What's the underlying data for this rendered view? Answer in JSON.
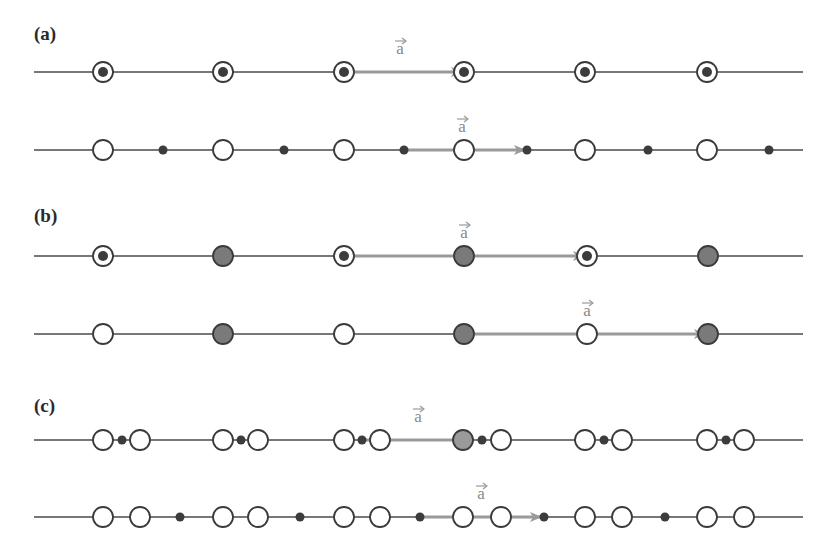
{
  "colors": {
    "line": "#4a4a4a",
    "atom_stroke": "#3a3a3a",
    "dot": "#3c3c3c",
    "gray_fill": "#7a7a7a",
    "arrow": "#9a9a9a",
    "background": "#ffffff"
  },
  "panels": [
    {
      "label": "(a)",
      "label_pos": [
        34,
        40
      ],
      "rows": [
        {
          "y": 72,
          "circles": [
            {
              "x": 103,
              "type": "ring-dot"
            },
            {
              "x": 223,
              "type": "ring-dot"
            },
            {
              "x": 344,
              "type": "ring-dot"
            },
            {
              "x": 464,
              "type": "ring-dot"
            },
            {
              "x": 585,
              "type": "ring-dot"
            },
            {
              "x": 707,
              "type": "ring-dot"
            }
          ],
          "dots": [],
          "vector": {
            "x1": 344,
            "x2": 462,
            "label": "a",
            "label_x": 400
          }
        },
        {
          "y": 150,
          "circles": [
            {
              "x": 103,
              "type": "open"
            },
            {
              "x": 223,
              "type": "open"
            },
            {
              "x": 344,
              "type": "open"
            },
            {
              "x": 464,
              "type": "open"
            },
            {
              "x": 585,
              "type": "open"
            },
            {
              "x": 707,
              "type": "open"
            }
          ],
          "dots": [
            163,
            284,
            404,
            527,
            648,
            769
          ],
          "vector": {
            "x1": 404,
            "x2": 525,
            "label": "a",
            "label_x": 462
          }
        }
      ]
    },
    {
      "label": "(b)",
      "label_pos": [
        34,
        222
      ],
      "rows": [
        {
          "y": 256,
          "circles": [
            {
              "x": 103,
              "type": "ring-dot"
            },
            {
              "x": 223,
              "type": "gray"
            },
            {
              "x": 344,
              "type": "ring-dot"
            },
            {
              "x": 464,
              "type": "gray"
            },
            {
              "x": 587,
              "type": "ring-dot"
            },
            {
              "x": 708,
              "type": "gray"
            }
          ],
          "dots": [],
          "vector": {
            "x1": 344,
            "x2": 584,
            "label": "a",
            "label_x": 464
          }
        },
        {
          "y": 334,
          "circles": [
            {
              "x": 103,
              "type": "open"
            },
            {
              "x": 223,
              "type": "gray"
            },
            {
              "x": 344,
              "type": "open"
            },
            {
              "x": 464,
              "type": "gray"
            },
            {
              "x": 587,
              "type": "open"
            },
            {
              "x": 708,
              "type": "gray"
            }
          ],
          "dots": [],
          "vector": {
            "x1": 464,
            "x2": 705,
            "label": "a",
            "label_x": 587
          }
        }
      ]
    },
    {
      "label": "(c)",
      "label_pos": [
        34,
        412
      ],
      "rows": [
        {
          "y": 440,
          "circles": [
            {
              "x": 103,
              "type": "open"
            },
            {
              "x": 140,
              "type": "open"
            },
            {
              "x": 223,
              "type": "open"
            },
            {
              "x": 258,
              "type": "open"
            },
            {
              "x": 344,
              "type": "open"
            },
            {
              "x": 380,
              "type": "open"
            },
            {
              "x": 463,
              "type": "gray-light"
            },
            {
              "x": 501,
              "type": "open"
            },
            {
              "x": 585,
              "type": "open"
            },
            {
              "x": 622,
              "type": "open"
            },
            {
              "x": 707,
              "type": "open"
            },
            {
              "x": 744,
              "type": "open"
            }
          ],
          "dots": [
            122,
            241,
            362,
            482,
            604,
            726
          ],
          "vector": {
            "x1": 362,
            "x2": 474,
            "label": "a",
            "label_x": 418
          }
        },
        {
          "y": 517,
          "circles": [
            {
              "x": 103,
              "type": "open"
            },
            {
              "x": 140,
              "type": "open"
            },
            {
              "x": 223,
              "type": "open"
            },
            {
              "x": 258,
              "type": "open"
            },
            {
              "x": 344,
              "type": "open"
            },
            {
              "x": 380,
              "type": "open"
            },
            {
              "x": 463,
              "type": "open"
            },
            {
              "x": 501,
              "type": "open"
            },
            {
              "x": 585,
              "type": "open"
            },
            {
              "x": 622,
              "type": "open"
            },
            {
              "x": 707,
              "type": "open"
            },
            {
              "x": 744,
              "type": "open"
            }
          ],
          "dots": [
            180,
            300,
            420,
            544,
            665
          ],
          "vector": {
            "x1": 420,
            "x2": 541,
            "label": "a",
            "label_x": 481
          }
        }
      ]
    }
  ],
  "line_extent": {
    "x1": 34,
    "x2": 803
  },
  "circle_radius": 10,
  "dot_radius": 4.5,
  "inner_dot_radius": 5
}
